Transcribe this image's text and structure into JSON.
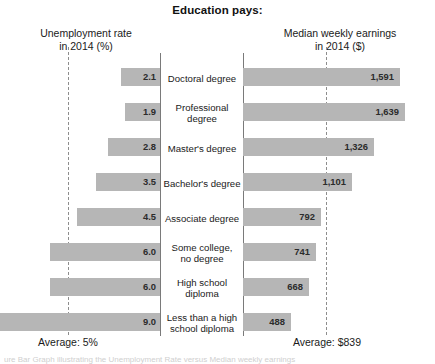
{
  "title": "Education pays:",
  "headers": {
    "left_line1": "Unemployment rate",
    "left_line2": "in 2014 (%)",
    "right_line1": "Median weekly earnings",
    "right_line2": "in 2014 ($)"
  },
  "averages": {
    "left_label": "Average: 5%",
    "right_label": "Average: $839",
    "unemployment_average": 5,
    "earnings_average": 839
  },
  "footnote": "ure Bar Graph illustrating the Unemployment Rate versus Median weekly earnings",
  "colors": {
    "bar_fill": "#b6b6b6",
    "axis": "#7a7a7a",
    "dash": "#8d8d8d",
    "text": "#1a1a1a",
    "background": "#ffffff"
  },
  "chart_data": {
    "type": "bar",
    "title": "Education pays:",
    "orientation": "horizontal-diverging",
    "categories": [
      "Doctoral degree",
      "Professional degree",
      "Master's degree",
      "Bachelor's degree",
      "Associate degree",
      "Some college, no degree",
      "High school diploma",
      "Less than a high school diploma"
    ],
    "category_lines": [
      [
        "Doctoral degree"
      ],
      [
        "Professional",
        "degree"
      ],
      [
        "Master's degree"
      ],
      [
        "Bachelor's degree"
      ],
      [
        "Associate degree"
      ],
      [
        "Some college,",
        "no degree"
      ],
      [
        "High school",
        "diploma"
      ],
      [
        "Less than a high",
        "school diploma"
      ]
    ],
    "series": [
      {
        "name": "Unemployment rate in 2014 (%)",
        "side": "left",
        "unit": "%",
        "xlabel": "Unemployment rate in 2014 (%)",
        "values": [
          2.1,
          1.9,
          2.8,
          3.5,
          4.5,
          6.0,
          6.0,
          9.0
        ],
        "labels": [
          "2.1",
          "1.9",
          "2.8",
          "3.5",
          "4.5",
          "6.0",
          "6.0",
          "9.0"
        ],
        "average": 5,
        "average_label": "Average: 5%",
        "xlim": [
          0,
          10
        ]
      },
      {
        "name": "Median weekly earnings in 2014 ($)",
        "side": "right",
        "unit": "$",
        "xlabel": "Median weekly earnings in 2014 ($)",
        "values": [
          1591,
          1639,
          1326,
          1101,
          792,
          741,
          668,
          488
        ],
        "labels": [
          "1,591",
          "1,639",
          "1,326",
          "1,101",
          "792",
          "741",
          "668",
          "488"
        ],
        "average": 839,
        "average_label": "Average: $839",
        "xlim": [
          0,
          1800
        ]
      }
    ],
    "grid": false,
    "legend": "none"
  }
}
